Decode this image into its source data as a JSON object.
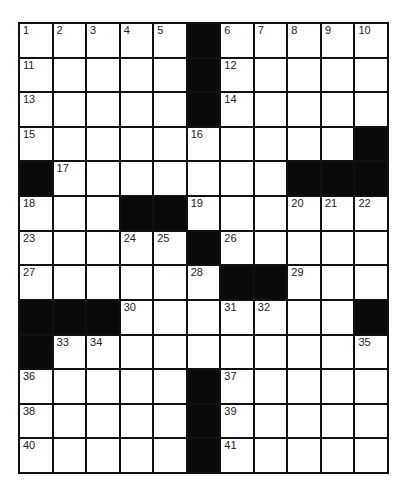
{
  "puzzle": {
    "rows": 13,
    "cols": 11,
    "colors": {
      "block": "#0a0a0a",
      "cell": "#ffffff",
      "line": "#111111"
    },
    "grid": [
      [
        "1",
        "2",
        "3",
        "4",
        "5",
        "#",
        "6",
        "7",
        "8",
        "9",
        "10"
      ],
      [
        "11",
        "",
        "",
        "",
        "",
        "#",
        "12",
        "",
        "",
        "",
        ""
      ],
      [
        "13",
        "",
        "",
        "",
        "",
        "#",
        "14",
        "",
        "",
        "",
        ""
      ],
      [
        "15",
        "",
        "",
        "",
        "",
        "16",
        "",
        "",
        "",
        "",
        "#"
      ],
      [
        "#",
        "17",
        "",
        "",
        "",
        "",
        "",
        "",
        "#",
        "#",
        "#"
      ],
      [
        "18",
        "",
        "",
        "#",
        "#",
        "19",
        "",
        "",
        "20",
        "21",
        "22"
      ],
      [
        "23",
        "",
        "",
        "24",
        "25",
        "#",
        "26",
        "",
        "",
        "",
        ""
      ],
      [
        "27",
        "",
        "",
        "",
        "",
        "28",
        "#",
        "#",
        "29",
        "",
        ""
      ],
      [
        "#",
        "#",
        "#",
        "30",
        "",
        "",
        "31",
        "32",
        "",
        "",
        "#"
      ],
      [
        "#",
        "33",
        "34",
        "",
        "",
        "",
        "",
        "",
        "",
        "",
        "35"
      ],
      [
        "36",
        "",
        "",
        "",
        "",
        "#",
        "37",
        "",
        "",
        "",
        ""
      ],
      [
        "38",
        "",
        "",
        "",
        "",
        "#",
        "39",
        "",
        "",
        "",
        ""
      ],
      [
        "40",
        "",
        "",
        "",
        "",
        "#",
        "41",
        "",
        "",
        "",
        ""
      ]
    ]
  }
}
